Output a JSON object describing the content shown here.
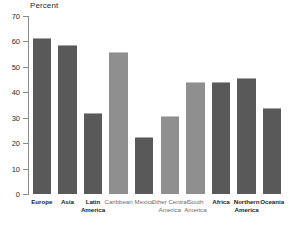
{
  "chart_data": {
    "type": "bar",
    "title": "",
    "subtitle": "",
    "xlabel": "",
    "ylabel": "Percent",
    "ylim": [
      0,
      70
    ],
    "yticks": [
      0,
      10,
      20,
      30,
      40,
      50,
      60,
      70
    ],
    "ytick_labels": [
      "0",
      "10",
      "20",
      "30",
      "40",
      "50",
      "60",
      "70"
    ],
    "grid": false,
    "legend": null,
    "categories": [
      "Europe",
      "Asia",
      "Latin America",
      "Caribbean",
      "Mexico",
      "Other Central America",
      "South America",
      "Africa",
      "Northern America",
      "Oceania"
    ],
    "bars": [
      {
        "label": "Europe",
        "value": 61.5,
        "shade": "dark",
        "emphasis": true
      },
      {
        "label": "Asia",
        "value": 58.5,
        "shade": "dark",
        "emphasis": true
      },
      {
        "label": "Latin America",
        "value": 32.0,
        "shade": "dark",
        "emphasis": true
      },
      {
        "label": "Caribbean",
        "value": 56.0,
        "shade": "light",
        "emphasis": false
      },
      {
        "label": "Mexico",
        "value": 22.5,
        "shade": "dark",
        "emphasis": false
      },
      {
        "label": "Other Central America",
        "value": 30.8,
        "shade": "light",
        "emphasis": false
      },
      {
        "label": "South America",
        "value": 44.0,
        "shade": "light",
        "emphasis": false
      },
      {
        "label": "Africa",
        "value": 44.0,
        "shade": "dark",
        "emphasis": true
      },
      {
        "label": "Northern America",
        "value": 45.5,
        "shade": "dark",
        "emphasis": true
      },
      {
        "label": "Oceania",
        "value": 34.0,
        "shade": "dark",
        "emphasis": true
      }
    ],
    "colors": {
      "bar_dark": "#595959",
      "bar_light": "#8f8f8f",
      "axis": "#8a8a8a",
      "text": "#1d1d1d",
      "background": "#ffffff"
    }
  }
}
